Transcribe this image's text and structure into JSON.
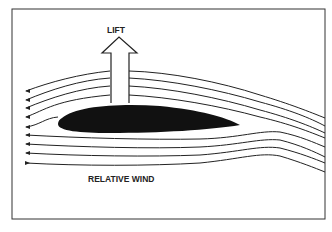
{
  "diagram": {
    "labels": {
      "lift": "LIFT",
      "relative_wind": "RELATIVE WIND"
    },
    "elements": {
      "airfoil": "airfoil",
      "lift_arrow": "lift-arrow",
      "streamlines_count": 9
    },
    "colors": {
      "stroke": "#222222",
      "airfoil_fill": "#111111",
      "background": "#ffffff"
    }
  }
}
